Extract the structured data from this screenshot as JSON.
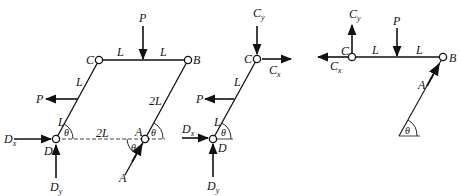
{
  "figure": {
    "panels": [
      {
        "name": "full-frame"
      },
      {
        "name": "member-CD"
      },
      {
        "name": "member-CB"
      }
    ]
  },
  "labels": {
    "P": "P",
    "C": "C",
    "B": "B",
    "A": "A",
    "D": "D",
    "L": "L",
    "twoL": "2L",
    "theta": "θ",
    "Dx_main": "D",
    "Dx_sub": "x",
    "Dy_main": "D",
    "Dy_sub": "y",
    "Cx_main": "C",
    "Cx_sub": "x",
    "Cy_main": "C",
    "Cy_sub": "y"
  },
  "colors": {
    "ink": "#111111",
    "background": "#ffffff"
  }
}
